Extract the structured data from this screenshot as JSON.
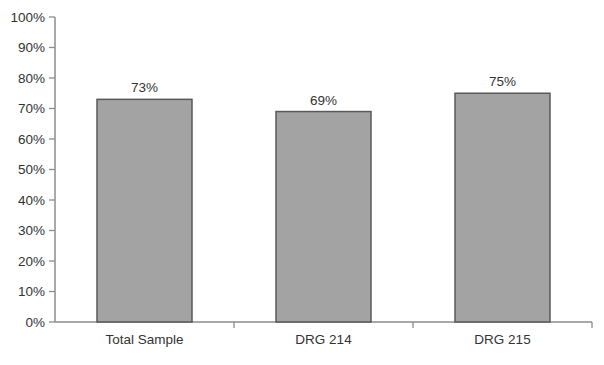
{
  "chart_data": {
    "type": "bar",
    "categories": [
      "Total Sample",
      "DRG 214",
      "DRG 215"
    ],
    "values": [
      73,
      69,
      75
    ],
    "data_labels": [
      "73%",
      "69%",
      "75%"
    ],
    "title": "",
    "xlabel": "",
    "ylabel": "",
    "ylim": [
      0,
      100
    ],
    "ytick_step": 10,
    "ytick_labels": [
      "0%",
      "10%",
      "20%",
      "30%",
      "40%",
      "50%",
      "60%",
      "70%",
      "80%",
      "90%",
      "100%"
    ],
    "grid": false,
    "legend": "none",
    "colors": {
      "bar_fill": "#a3a3a3",
      "bar_border": "#595959",
      "axis": "#8c8c8c",
      "text": "#333333",
      "background": "#ffffff"
    }
  }
}
